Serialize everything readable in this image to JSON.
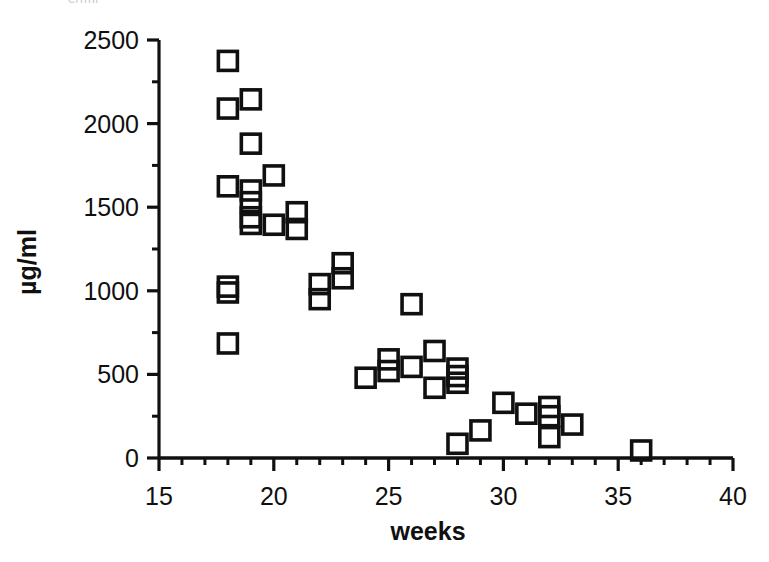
{
  "figure": {
    "clipped_header_text": "e/fml",
    "background_color": "#ffffff",
    "marker_color": "#101010",
    "axis_color": "#101010"
  },
  "chart_data": {
    "type": "scatter",
    "title": "",
    "xlabel": "weeks",
    "ylabel": "µg/ml",
    "xlim": [
      15,
      40
    ],
    "ylim": [
      0,
      2500
    ],
    "xticks": [
      15,
      20,
      25,
      30,
      35,
      40
    ],
    "xtick_labels": [
      "15",
      "20",
      "25",
      "30",
      "35",
      "40"
    ],
    "x_minor_ticks": [
      16,
      17,
      18,
      19,
      21,
      22,
      23,
      24,
      26,
      27,
      28,
      29,
      31,
      32,
      33,
      34,
      36,
      37,
      38,
      39
    ],
    "yticks": [
      0,
      500,
      1000,
      1500,
      2000,
      2500
    ],
    "ytick_labels": [
      "0",
      "500",
      "1000",
      "1500",
      "2000",
      "2500"
    ],
    "y_minor_ticks": [
      250,
      750,
      1250,
      1750,
      2250
    ],
    "grid": false,
    "legend": false,
    "marker": "open-square",
    "points": [
      {
        "x": 18,
        "y": 2375
      },
      {
        "x": 18,
        "y": 2090
      },
      {
        "x": 19,
        "y": 2145
      },
      {
        "x": 19,
        "y": 1880
      },
      {
        "x": 18,
        "y": 1625
      },
      {
        "x": 19,
        "y": 1600
      },
      {
        "x": 19,
        "y": 1530
      },
      {
        "x": 19,
        "y": 1440
      },
      {
        "x": 19,
        "y": 1400
      },
      {
        "x": 20,
        "y": 1690
      },
      {
        "x": 20,
        "y": 1395
      },
      {
        "x": 21,
        "y": 1470
      },
      {
        "x": 21,
        "y": 1370
      },
      {
        "x": 18,
        "y": 1025
      },
      {
        "x": 18,
        "y": 990
      },
      {
        "x": 18,
        "y": 685
      },
      {
        "x": 22,
        "y": 1040
      },
      {
        "x": 22,
        "y": 950
      },
      {
        "x": 23,
        "y": 1165
      },
      {
        "x": 23,
        "y": 1075
      },
      {
        "x": 24,
        "y": 480
      },
      {
        "x": 25,
        "y": 590
      },
      {
        "x": 25,
        "y": 520
      },
      {
        "x": 26,
        "y": 920
      },
      {
        "x": 26,
        "y": 545
      },
      {
        "x": 27,
        "y": 640
      },
      {
        "x": 27,
        "y": 420
      },
      {
        "x": 28,
        "y": 535
      },
      {
        "x": 28,
        "y": 490
      },
      {
        "x": 28,
        "y": 450
      },
      {
        "x": 28,
        "y": 85
      },
      {
        "x": 29,
        "y": 165
      },
      {
        "x": 30,
        "y": 330
      },
      {
        "x": 31,
        "y": 265
      },
      {
        "x": 32,
        "y": 305
      },
      {
        "x": 32,
        "y": 250
      },
      {
        "x": 32,
        "y": 125
      },
      {
        "x": 33,
        "y": 200
      },
      {
        "x": 36,
        "y": 45
      }
    ]
  }
}
